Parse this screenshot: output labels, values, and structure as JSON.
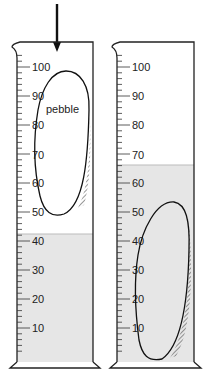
{
  "colors": {
    "water": "#e6e6e6",
    "line": "#222222",
    "background": "#ffffff"
  },
  "arrow": {
    "meaning": "pebble dropped into cylinder",
    "icon": "down-arrow-icon"
  },
  "cylinders": [
    {
      "id": "before",
      "water_level": 42,
      "scale_labels": [
        "100",
        "90",
        "80",
        "70",
        "60",
        "50",
        "40",
        "30",
        "20",
        "10"
      ],
      "pebble_label": "pebble",
      "pebble_position": "held above water"
    },
    {
      "id": "after",
      "water_level": 66,
      "scale_labels": [
        "100",
        "90",
        "80",
        "70",
        "60",
        "50",
        "40",
        "30",
        "20",
        "10"
      ],
      "pebble_position": "submerged"
    }
  ]
}
